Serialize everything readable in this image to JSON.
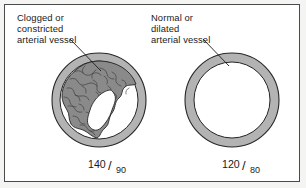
{
  "figure": {
    "background_color": "#ffffff",
    "border_color": "#4a4a4a"
  },
  "colors": {
    "vessel_wall": "#b3b3b3",
    "plaque": "#8a8a8a",
    "lumen": "#ffffff",
    "outline": "#262626",
    "text": "#1a1a1a"
  },
  "panels": [
    {
      "id": "clogged",
      "label_lines": [
        "Clogged or",
        "constricted",
        "arterial vessel"
      ],
      "label_full": "Clogged or constricted arterial vessel",
      "vessel_type": "clogged",
      "blood_pressure": {
        "systolic": "140",
        "separator": "/",
        "diastolic": "90",
        "full": "140/90"
      }
    },
    {
      "id": "normal",
      "label_lines": [
        "Normal or",
        "dilated",
        "arterial vessel"
      ],
      "label_full": "Normal or dilated arterial vessel",
      "vessel_type": "normal",
      "blood_pressure": {
        "systolic": "120",
        "separator": "/",
        "diastolic": "80",
        "full": "120/80"
      }
    }
  ]
}
